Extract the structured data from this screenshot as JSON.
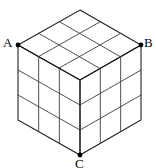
{
  "figure": {
    "name": "isometric-3x3x3-cube",
    "background_color": "#ffffff",
    "line_color": "#3b3b3b",
    "outline_color": "#1a1a1a",
    "vertex_dot_color": "#000000",
    "label_color": "#000000",
    "divisions_per_edge": 3,
    "visible_faces": [
      "top",
      "left",
      "right"
    ],
    "cells_per_face": 9,
    "total_visible_cells": 27
  },
  "labels": {
    "a": "A",
    "b": "B",
    "c": "C"
  },
  "vertices": {
    "top": {
      "x": 80,
      "y": 10
    },
    "left": {
      "x": 18,
      "y": 45
    },
    "right": {
      "x": 141,
      "y": 45
    },
    "front_top": {
      "x": 80,
      "y": 80
    },
    "bottom_left": {
      "x": 18,
      "y": 120
    },
    "bottom_right": {
      "x": 141,
      "y": 120
    },
    "bottom": {
      "x": 80,
      "y": 155
    }
  },
  "marked_vertices": [
    {
      "label": "A",
      "x": 18,
      "y": 45
    },
    {
      "label": "B",
      "x": 141,
      "y": 45
    },
    {
      "label": "C",
      "x": 80,
      "y": 155
    }
  ]
}
